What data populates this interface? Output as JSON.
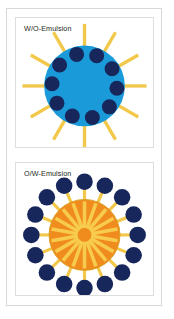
{
  "figure": {
    "title": "Emulsion types schematic",
    "background_color": "#ffffff",
    "frame_color": "#d8d8d8",
    "panel_border_color": "#dedede"
  },
  "panels": [
    {
      "id": "w-o-emulsion",
      "label": "W/O-Emulsion",
      "description": "Water-in-oil emulsion: blue continuous droplet with dark inner water droplets and outward oil rays",
      "core": {
        "name": "blue-droplet",
        "color": "#1a9ad8",
        "cx": 69.5,
        "cy": 69,
        "r": 41
      },
      "inner_droplets": {
        "name": "water-droplets",
        "color": "#17275c",
        "count": 10,
        "radius": 7.6,
        "ring_radius": 33,
        "start_angle": -104
      },
      "rays": {
        "name": "oil-rays",
        "color": "#f2c84b",
        "count": 12,
        "inner_radius": 40,
        "outer_radius": 63,
        "width": 3.4,
        "start_angle": -90
      }
    },
    {
      "id": "o-w-emulsion",
      "label": "O/W-Emulsion",
      "description": "Oil-in-water emulsion: orange core with inward rays, encircled by dark droplets on yellow stems",
      "core": {
        "name": "orange-droplet",
        "color": "#f08c1e",
        "stroke": "#d9a227",
        "cx": 69.5,
        "cy": 73,
        "r": 36
      },
      "inner_rays": {
        "name": "inner-rays",
        "color": "#f7cc4e",
        "count": 18,
        "inner_radius": 7,
        "outer_radius": 34,
        "width": 3.6,
        "start_angle": -90
      },
      "stems": {
        "name": "droplet-stems",
        "color": "#f2c84b",
        "count": 16,
        "inner_radius": 35,
        "outer_radius": 47,
        "width": 3.2,
        "start_angle": -90
      },
      "outer_droplets": {
        "name": "water-droplets",
        "color": "#17275c",
        "count": 16,
        "radius": 8.4,
        "ring_radius": 54,
        "start_angle": -90
      }
    }
  ],
  "chart_data": {
    "type": "diagram",
    "title": "Emulsion types schematic",
    "categories": [
      "W/O-Emulsion",
      "O/W-Emulsion"
    ],
    "series": [
      {
        "name": "W/O-Emulsion",
        "core_color": "#1a9ad8",
        "droplet_color": "#17275c",
        "ray_color": "#f2c84b",
        "droplet_count": 10,
        "ray_count": 12,
        "droplets_inside_core": true
      },
      {
        "name": "O/W-Emulsion",
        "core_color": "#f08c1e",
        "droplet_color": "#17275c",
        "ray_color": "#f7cc4e",
        "droplet_count": 16,
        "ray_count": 18,
        "droplets_inside_core": false
      }
    ],
    "xlabel": "",
    "ylabel": "",
    "legend": false,
    "grid": false
  }
}
